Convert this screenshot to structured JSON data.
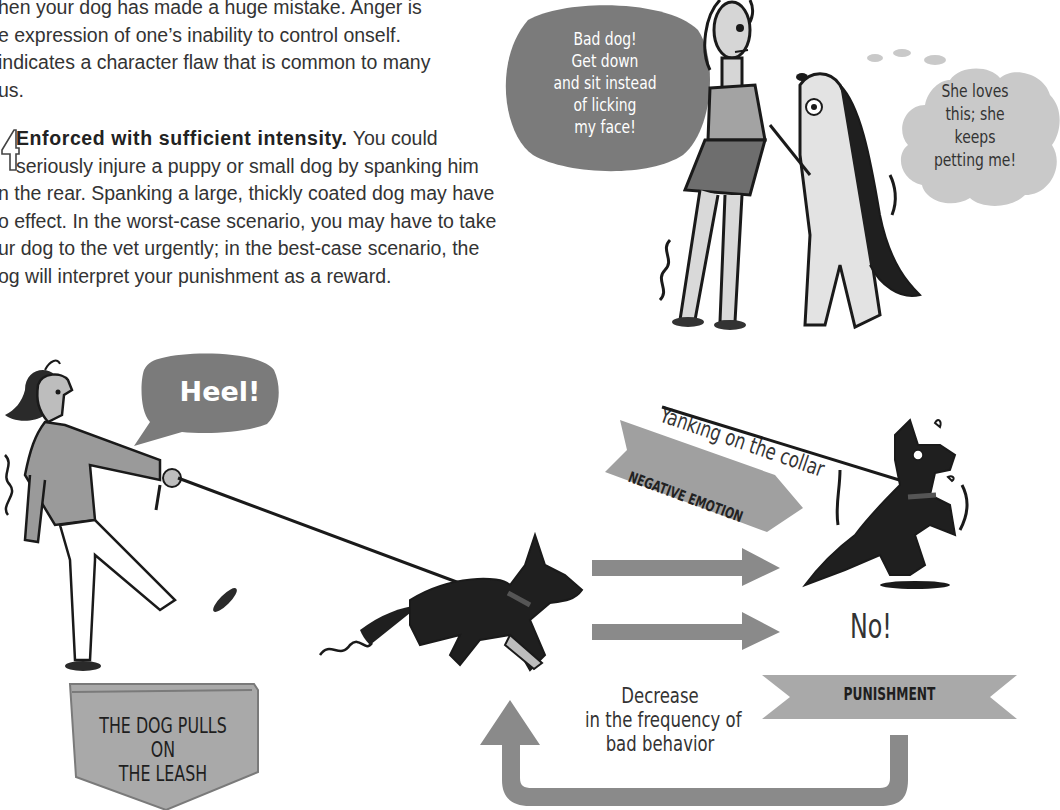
{
  "text_block": {
    "line1": "hen your dog has made a huge mistake. Anger is",
    "line2": "e expression of one’s inability to control onself.",
    "line3": "indicates a character flaw that is common to many",
    "line4": " us.",
    "point_number": "4",
    "point_heading": "Enforced with sufficient intensity.",
    "point_line1_rest": " You could",
    "point_line2": "seriously injure a puppy or small dog by spanking him",
    "point_line3": "n the rear. Spanking a large, thickly coated dog may have",
    "point_line4": "o effect. In the worst-case scenario, you may have to take",
    "point_line5": "ur dog to the vet urgently; in the best-case scenario, the",
    "point_line6": "og will interpret your punishment as a reward."
  },
  "top_illustration": {
    "speech_bubble": [
      "Bad dog!",
      "Get down",
      "and sit instead",
      "of licking",
      "my face!"
    ],
    "thought_bubble": [
      "She loves",
      "this; she",
      "keeps",
      "petting me!"
    ]
  },
  "bottom_illustration": {
    "speech_bubble": "Heel!",
    "start_label": [
      "THE DOG PULLS ON",
      "THE LEASH"
    ],
    "action_caption": "Yanking on the collar",
    "arrow_label": "NEGATIVE EMOTION",
    "dog_exclamation": "No!",
    "punishment_label": "PUNISHMENT",
    "result_caption": [
      "Decrease",
      "in the frequency of",
      "bad behavior"
    ]
  },
  "colors": {
    "bubble_gray": "#7b7b7b",
    "thought_gray": "#c9c9c9",
    "arrow_gray": "#8a8a8a",
    "label_gray": "#a9a9a9",
    "ink": "#1a1a1a"
  }
}
